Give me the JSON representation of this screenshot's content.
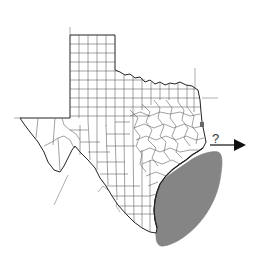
{
  "map": {
    "subject": "Texas county map",
    "highlighted_region": "Gulf of Mexico coastal waters (shaded)",
    "arrow_label": "?",
    "colors": {
      "outline": "#222222",
      "county_lines": "#555555",
      "shaded_region": "#858585",
      "background": "#ffffff",
      "guide_lines": "#999999"
    }
  }
}
